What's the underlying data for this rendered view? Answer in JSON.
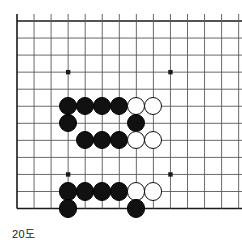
{
  "figure": {
    "caption": "20도",
    "kind": "go-board-diagram"
  },
  "board": {
    "origin_x": 17,
    "origin_y": 21,
    "pitch": 17.05,
    "cols_visible": 14,
    "rows_visible": 12,
    "edges": {
      "left": true,
      "top": true,
      "bottom": true,
      "right": false
    },
    "line_color": "#5a5a5a",
    "edge_color": "#1a1a1a",
    "star_color": "#1a1a1a",
    "stone_radius": 9.1,
    "star_points": [
      {
        "col": 3,
        "row": 3
      },
      {
        "col": 9,
        "row": 3
      },
      {
        "col": 3,
        "row": 9
      },
      {
        "col": 9,
        "row": 9
      }
    ],
    "black_color": "#111111",
    "white_color": "#ffffff"
  },
  "stones": [
    {
      "col": 3,
      "row": 5,
      "color": "black"
    },
    {
      "col": 4,
      "row": 5,
      "color": "black"
    },
    {
      "col": 5,
      "row": 5,
      "color": "black"
    },
    {
      "col": 6,
      "row": 5,
      "color": "black"
    },
    {
      "col": 7,
      "row": 5,
      "color": "white"
    },
    {
      "col": 8,
      "row": 5,
      "color": "white"
    },
    {
      "col": 3,
      "row": 6,
      "color": "black"
    },
    {
      "col": 7,
      "row": 6,
      "color": "black"
    },
    {
      "col": 4,
      "row": 7,
      "color": "black"
    },
    {
      "col": 5,
      "row": 7,
      "color": "black"
    },
    {
      "col": 6,
      "row": 7,
      "color": "black"
    },
    {
      "col": 7,
      "row": 7,
      "color": "white"
    },
    {
      "col": 8,
      "row": 7,
      "color": "white"
    },
    {
      "col": 3,
      "row": 10,
      "color": "black"
    },
    {
      "col": 4,
      "row": 10,
      "color": "black"
    },
    {
      "col": 5,
      "row": 10,
      "color": "black"
    },
    {
      "col": 6,
      "row": 10,
      "color": "black"
    },
    {
      "col": 7,
      "row": 10,
      "color": "white"
    },
    {
      "col": 8,
      "row": 10,
      "color": "white"
    },
    {
      "col": 3,
      "row": 11,
      "color": "black"
    },
    {
      "col": 7,
      "row": 11,
      "color": "black"
    }
  ]
}
